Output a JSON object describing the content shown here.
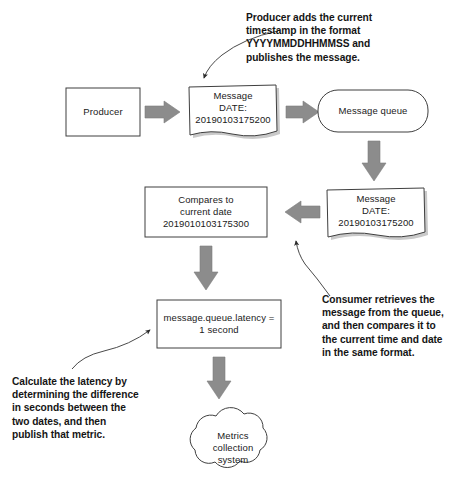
{
  "diagram": {
    "colors": {
      "arrow_fill": "#8c8c8c",
      "arrow_stroke": "#7a7a7a",
      "node_stroke": "#3f3f3f",
      "node_fill": "#ffffff",
      "shadow": "#c9c9c9",
      "text": "#1a1a1a",
      "annotation_text": "#151515",
      "pointer_line": "#4a4a4a"
    },
    "nodes": [
      {
        "id": "producer",
        "shape": "rectangle",
        "lines": [
          "Producer"
        ]
      },
      {
        "id": "message-published",
        "shape": "document",
        "lines": [
          "Message",
          "DATE:",
          "20190103175200"
        ]
      },
      {
        "id": "message-queue",
        "shape": "rounded-rectangle",
        "lines": [
          "Message queue"
        ]
      },
      {
        "id": "message-consumed",
        "shape": "document",
        "lines": [
          "Message",
          "DATE:",
          "20190103175200"
        ]
      },
      {
        "id": "compares-current-date",
        "shape": "rectangle",
        "lines": [
          "Compares to",
          "current date",
          "2019010103175300"
        ]
      },
      {
        "id": "latency-metric",
        "shape": "rectangle",
        "lines": [
          "message.queue.latency =",
          "1 second"
        ]
      },
      {
        "id": "metrics-collection-system",
        "shape": "cloud",
        "lines": [
          "Metrics",
          "collection",
          "system"
        ]
      }
    ],
    "annotations": [
      {
        "id": "producer-note",
        "lines": [
          "Producer adds the current",
          "timestamp in the format",
          "YYYYMMDDHHMMSS and",
          "publishes the message."
        ]
      },
      {
        "id": "consumer-note",
        "lines": [
          "Consumer retrieves the",
          "message from the queue,",
          "and then compares it to",
          "the current time and date",
          "in the same format."
        ]
      },
      {
        "id": "latency-note",
        "lines": [
          "Calculate the latency by",
          "determining the difference",
          "in seconds between the",
          "two dates, and then",
          "publish that metric."
        ]
      }
    ],
    "connectors": [
      {
        "id": "producer-to-message",
        "direction": "right"
      },
      {
        "id": "message-to-queue",
        "direction": "right"
      },
      {
        "id": "queue-to-consumed-message",
        "direction": "down"
      },
      {
        "id": "consumed-message-to-compares",
        "direction": "left"
      },
      {
        "id": "compares-to-latency",
        "direction": "down"
      },
      {
        "id": "latency-to-metrics",
        "direction": "down"
      }
    ]
  }
}
